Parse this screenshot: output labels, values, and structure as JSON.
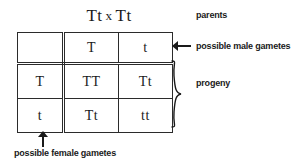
{
  "diagram": {
    "title_cross": {
      "left_parent": "Tt",
      "operator": "x",
      "right_parent": "Tt"
    },
    "punnett": {
      "corner_cell": "",
      "male_gametes": [
        "T",
        "t"
      ],
      "female_gametes": [
        "T",
        "t"
      ],
      "progeny": [
        [
          "TT",
          "Tt"
        ],
        [
          "Tt",
          "tt"
        ]
      ]
    },
    "annotations": {
      "parents": "parents",
      "male_gametes": "possible male gametes",
      "progeny": "progeny",
      "female_gametes": "possible female gametes"
    },
    "colors": {
      "ink": "#1a1a1a",
      "rule": "#2b2b2b",
      "background": "#ffffff"
    }
  }
}
